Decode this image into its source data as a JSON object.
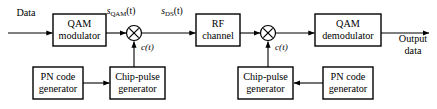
{
  "diagram": {
    "type": "block-diagram",
    "canvas": {
      "width": 437,
      "height": 109,
      "background": "#ffffff"
    },
    "stroke_color": "#000000",
    "blocks": [
      {
        "id": "qam-modulator",
        "line1": "QAM",
        "line2": "modulator",
        "x": 53,
        "y": 14,
        "w": 53,
        "h": 32
      },
      {
        "id": "rf-channel",
        "line1": "RF",
        "line2": "channel",
        "x": 196,
        "y": 14,
        "w": 44,
        "h": 32
      },
      {
        "id": "qam-demodulator",
        "line1": "QAM",
        "line2": "demodulator",
        "x": 315,
        "y": 14,
        "w": 66,
        "h": 32
      },
      {
        "id": "pn-code-generator-tx",
        "line1": "PN code",
        "line2": "generator",
        "x": 33,
        "y": 67,
        "w": 50,
        "h": 32
      },
      {
        "id": "chip-pulse-generator-tx",
        "line1": "Chip-pulse",
        "line2": "generator",
        "x": 110,
        "y": 67,
        "w": 55,
        "h": 32
      },
      {
        "id": "chip-pulse-generator-rx",
        "line1": "Chip-pulse",
        "line2": "generator",
        "x": 238,
        "y": 67,
        "w": 55,
        "h": 32
      },
      {
        "id": "pn-code-generator-rx",
        "line1": "PN code",
        "line2": "generator",
        "x": 323,
        "y": 67,
        "w": 50,
        "h": 32
      }
    ],
    "multipliers": [
      {
        "id": "multiplier-tx",
        "cx": 134,
        "cy": 33,
        "r": 7.5
      },
      {
        "id": "multiplier-rx",
        "cx": 268,
        "cy": 33,
        "r": 7.5
      }
    ],
    "io_labels": [
      {
        "id": "input-data-label",
        "text": "Data",
        "x": 26,
        "y": 14
      },
      {
        "id": "output-data-line1",
        "text": "Output",
        "x": 413,
        "y": 40
      },
      {
        "id": "output-data-line2",
        "text": "data",
        "x": 413,
        "y": 52
      }
    ],
    "signal_labels": [
      {
        "id": "s-qam-label",
        "base": "s",
        "sub": "QAM",
        "arg": "(t)",
        "x": 121,
        "y": 12
      },
      {
        "id": "s-ds-label",
        "base": "s",
        "sub": "DS",
        "arg": "(t)",
        "x": 172,
        "y": 12
      }
    ],
    "carrier_labels": [
      {
        "id": "c-t-label-tx",
        "base": "c",
        "arg": "(t)",
        "x": 141,
        "y": 48
      },
      {
        "id": "c-t-label-rx",
        "base": "c",
        "arg": "(t)",
        "x": 275,
        "y": 48
      }
    ],
    "connections": [
      {
        "id": "wire-data-to-qam-modulator",
        "from": "Data input",
        "to": "QAM modulator"
      },
      {
        "id": "wire-qam-modulator-to-multiplier",
        "from": "QAM modulator",
        "to": "multiplier-tx",
        "signal": "s_QAM(t)"
      },
      {
        "id": "wire-multiplier-to-rf-channel",
        "from": "multiplier-tx",
        "to": "RF channel",
        "signal": "s_DS(t)"
      },
      {
        "id": "wire-rf-channel-to-multiplier",
        "from": "RF channel",
        "to": "multiplier-rx"
      },
      {
        "id": "wire-multiplier-to-demodulator",
        "from": "multiplier-rx",
        "to": "QAM demodulator"
      },
      {
        "id": "wire-demodulator-to-output",
        "from": "QAM demodulator",
        "to": "Output data"
      },
      {
        "id": "wire-pn-tx-to-chip-tx",
        "from": "PN code generator (Tx)",
        "to": "Chip-pulse generator (Tx)"
      },
      {
        "id": "wire-chip-tx-to-multiplier",
        "from": "Chip-pulse generator (Tx)",
        "to": "multiplier-tx",
        "signal": "c(t)"
      },
      {
        "id": "wire-pn-rx-to-chip-rx",
        "from": "PN code generator (Rx)",
        "to": "Chip-pulse generator (Rx)"
      },
      {
        "id": "wire-chip-rx-to-multiplier",
        "from": "Chip-pulse generator (Rx)",
        "to": "multiplier-rx",
        "signal": "c(t)"
      }
    ]
  }
}
